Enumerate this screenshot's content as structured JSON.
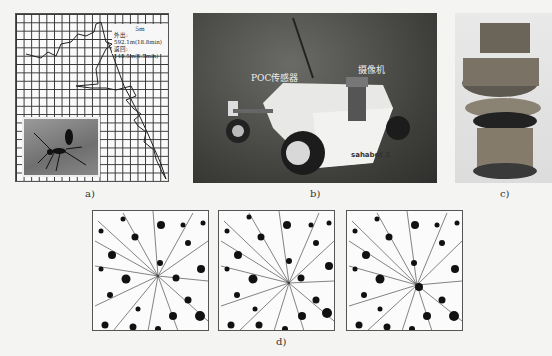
{
  "figure": {
    "panels": [
      {
        "id": "a",
        "caption": "a)",
        "description": "Desert ant foraging path on grid",
        "legend": {
          "scale": "5m",
          "outbound": "外出: 592.1m(18.8min)",
          "return": "返回: 140.5m(6.5min)"
        },
        "inset": "ant photograph"
      },
      {
        "id": "b",
        "caption": "b)",
        "description": "Sahabot 2 robot photograph",
        "labels": {
          "sensor": "POC传感器",
          "camera": "摄像机",
          "robot_name": "sahabot 2"
        }
      },
      {
        "id": "c",
        "caption": "c)",
        "description": "Stacked circuit-board robot photograph"
      },
      {
        "id": "d",
        "caption": "d)",
        "description": "Three simulated path networks among obstacles",
        "subplots": 3
      }
    ]
  }
}
